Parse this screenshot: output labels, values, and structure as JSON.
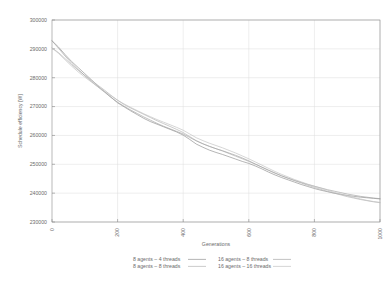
{
  "chart_data": {
    "type": "line",
    "title": "",
    "xlabel": "Generations",
    "ylabel": "Schedule efficiency [W]",
    "xlim": [
      0,
      1000
    ],
    "ylim": [
      230000,
      300000
    ],
    "grid": true,
    "legend_position": "bottom",
    "x_ticks": [
      "0",
      "200",
      "400",
      "600",
      "800",
      "1000"
    ],
    "x_tick_values": [
      0,
      200,
      400,
      600,
      800,
      1000
    ],
    "y_ticks": [
      "230000",
      "240000",
      "250000",
      "260000",
      "270000",
      "280000",
      "290000",
      "300000"
    ],
    "y_tick_values": [
      230000,
      240000,
      250000,
      260000,
      270000,
      280000,
      290000,
      300000
    ],
    "x": [
      0,
      20,
      40,
      60,
      80,
      100,
      120,
      140,
      160,
      180,
      200,
      220,
      240,
      260,
      280,
      300,
      320,
      340,
      360,
      380,
      400,
      420,
      440,
      460,
      480,
      500,
      520,
      540,
      560,
      580,
      600,
      620,
      640,
      660,
      680,
      700,
      720,
      740,
      760,
      780,
      800,
      820,
      840,
      860,
      880,
      900,
      920,
      940,
      960,
      980,
      1000
    ],
    "series": [
      {
        "name": "8 agents – 4 threads",
        "color": "#8c8c8c",
        "values": [
          292800,
          290600,
          288000,
          285600,
          283500,
          281400,
          279300,
          277100,
          275200,
          273200,
          271300,
          269900,
          268500,
          267200,
          265900,
          264800,
          263900,
          263000,
          262100,
          261200,
          260100,
          258600,
          257000,
          255900,
          254900,
          254100,
          253400,
          252600,
          251800,
          251000,
          250300,
          249400,
          248400,
          247300,
          246300,
          245400,
          244600,
          243800,
          243000,
          242300,
          241600,
          241000,
          240500,
          240000,
          239600,
          239200,
          238900,
          238600,
          238400,
          238200,
          238000
        ]
      },
      {
        "name": "8 agents – 8 threads",
        "color": "#b0b0b0",
        "values": [
          290300,
          288700,
          286600,
          284500,
          282600,
          280800,
          279100,
          277400,
          275700,
          273900,
          272200,
          270700,
          269500,
          268400,
          267300,
          266200,
          265100,
          264100,
          263100,
          262100,
          261000,
          259600,
          258200,
          257100,
          256200,
          255400,
          254600,
          253700,
          252800,
          251900,
          251000,
          250000,
          249000,
          248000,
          247000,
          246000,
          245100,
          244300,
          243500,
          242700,
          242000,
          241300,
          240600,
          240000,
          239400,
          238800,
          238300,
          237800,
          237400,
          237000,
          236700
        ]
      },
      {
        "name": "16 agents – 8 threads",
        "color": "#a0a0a0",
        "values": [
          292800,
          290200,
          287500,
          285000,
          282800,
          280700,
          278700,
          276800,
          275000,
          273200,
          271500,
          270100,
          268800,
          267600,
          266400,
          265300,
          264200,
          263200,
          262300,
          261400,
          260500,
          259300,
          258100,
          257100,
          256200,
          255400,
          254700,
          253900,
          253100,
          252200,
          251200,
          250100,
          249000,
          247900,
          246900,
          246000,
          245200,
          244400,
          243700,
          243000,
          242400,
          241800,
          241200,
          240700,
          240200,
          239700,
          239300,
          238900,
          238600,
          238300,
          238100
        ]
      },
      {
        "name": "16 agents – 16 threads",
        "color": "#c0c0c0",
        "values": [
          290300,
          288400,
          286200,
          284000,
          282000,
          280200,
          278500,
          276900,
          275300,
          273700,
          272200,
          270900,
          269700,
          268600,
          267500,
          266500,
          265500,
          264600,
          263700,
          262800,
          261800,
          260500,
          259200,
          258200,
          257300,
          256500,
          255700,
          254800,
          253900,
          252900,
          251900,
          250800,
          249700,
          248600,
          247500,
          246500,
          245600,
          244700,
          243900,
          243100,
          242400,
          241700,
          241000,
          240300,
          239700,
          239100,
          238500,
          238000,
          237500,
          237100,
          236800
        ]
      }
    ]
  },
  "legend": {
    "entries": [
      {
        "label": "8 agents – 4 threads"
      },
      {
        "label": "16 agents – 8 threads"
      },
      {
        "label": "8 agents – 8 threads"
      },
      {
        "label": "16 agents – 16 threads"
      }
    ]
  }
}
